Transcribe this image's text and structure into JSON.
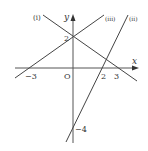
{
  "diagram": {
    "type": "coordinate-plane-lines",
    "axes": {
      "x_label": "x",
      "y_label": "y",
      "origin_label": "O"
    },
    "ticks": {
      "x_neg3": "−3",
      "x_2": "2",
      "x_3": "3",
      "y_2": "2",
      "y_neg4": "−4"
    },
    "lines": [
      {
        "label": "(i)",
        "equation": "y = -2/3 x + 2",
        "x_intercept": 3,
        "y_intercept": 2
      },
      {
        "label": "(ii)",
        "equation": "y = 2x - 4",
        "x_intercept": 2,
        "y_intercept": -4
      },
      {
        "label": "(iii)",
        "equation": "y = 2/3 x + 2",
        "x_intercept": -3,
        "y_intercept": 2
      }
    ],
    "colors": {
      "line": "#444444",
      "text": "#333333",
      "background": "#ffffff"
    }
  }
}
